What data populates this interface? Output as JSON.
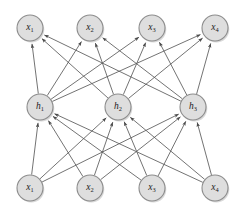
{
  "diagram": {
    "type": "neural-network",
    "background_color": "#ffffff",
    "node_fill_color": "#dedede",
    "node_stroke_color": "#8c8c8c",
    "edge_color": "#5a5a5a",
    "label_color": "#1a1a1a",
    "node_radius": 13,
    "edge_direction": "upward",
    "layers": [
      {
        "id": "output-layer",
        "name": "output-layer",
        "row": "top",
        "y": 28,
        "nodes": [
          {
            "id": "out-x1",
            "base": "x",
            "sub": "1",
            "label": "x1",
            "x": 30,
            "y": 28
          },
          {
            "id": "out-x2",
            "base": "x",
            "sub": "2",
            "label": "x2",
            "x": 90,
            "y": 28
          },
          {
            "id": "out-x3",
            "base": "x",
            "sub": "3",
            "label": "x3",
            "x": 152,
            "y": 28
          },
          {
            "id": "out-x4",
            "base": "x",
            "sub": "4",
            "label": "x4",
            "x": 215,
            "y": 28
          }
        ]
      },
      {
        "id": "hidden-layer",
        "name": "hidden-layer",
        "row": "middle",
        "y": 107,
        "nodes": [
          {
            "id": "hid-h1",
            "base": "h",
            "sub": "1",
            "label": "h1",
            "x": 40,
            "y": 107
          },
          {
            "id": "hid-h2",
            "base": "h",
            "sub": "2",
            "label": "h2",
            "x": 118,
            "y": 107
          },
          {
            "id": "hid-h3",
            "base": "h",
            "sub": "3",
            "label": "h3",
            "x": 193,
            "y": 107
          }
        ]
      },
      {
        "id": "input-layer",
        "name": "input-layer",
        "row": "bottom",
        "y": 188,
        "nodes": [
          {
            "id": "in-x1",
            "base": "x",
            "sub": "1",
            "label": "x1",
            "x": 30,
            "y": 188
          },
          {
            "id": "in-x2",
            "base": "x",
            "sub": "2",
            "label": "x2",
            "x": 90,
            "y": 188
          },
          {
            "id": "in-x3",
            "base": "x",
            "sub": "3",
            "label": "x3",
            "x": 152,
            "y": 188
          },
          {
            "id": "in-x4",
            "base": "x",
            "sub": "4",
            "label": "x4",
            "x": 215,
            "y": 188
          }
        ]
      }
    ],
    "edges": [
      {
        "from": "in-x1",
        "to": "hid-h1"
      },
      {
        "from": "in-x1",
        "to": "hid-h2"
      },
      {
        "from": "in-x1",
        "to": "hid-h3"
      },
      {
        "from": "in-x2",
        "to": "hid-h1"
      },
      {
        "from": "in-x2",
        "to": "hid-h2"
      },
      {
        "from": "in-x2",
        "to": "hid-h3"
      },
      {
        "from": "in-x3",
        "to": "hid-h1"
      },
      {
        "from": "in-x3",
        "to": "hid-h2"
      },
      {
        "from": "in-x3",
        "to": "hid-h3"
      },
      {
        "from": "in-x4",
        "to": "hid-h1"
      },
      {
        "from": "in-x4",
        "to": "hid-h2"
      },
      {
        "from": "in-x4",
        "to": "hid-h3"
      },
      {
        "from": "hid-h1",
        "to": "out-x1"
      },
      {
        "from": "hid-h1",
        "to": "out-x2"
      },
      {
        "from": "hid-h1",
        "to": "out-x3"
      },
      {
        "from": "hid-h1",
        "to": "out-x4"
      },
      {
        "from": "hid-h2",
        "to": "out-x1"
      },
      {
        "from": "hid-h2",
        "to": "out-x2"
      },
      {
        "from": "hid-h2",
        "to": "out-x3"
      },
      {
        "from": "hid-h2",
        "to": "out-x4"
      },
      {
        "from": "hid-h3",
        "to": "out-x1"
      },
      {
        "from": "hid-h3",
        "to": "out-x2"
      },
      {
        "from": "hid-h3",
        "to": "out-x3"
      },
      {
        "from": "hid-h3",
        "to": "out-x4"
      }
    ]
  }
}
